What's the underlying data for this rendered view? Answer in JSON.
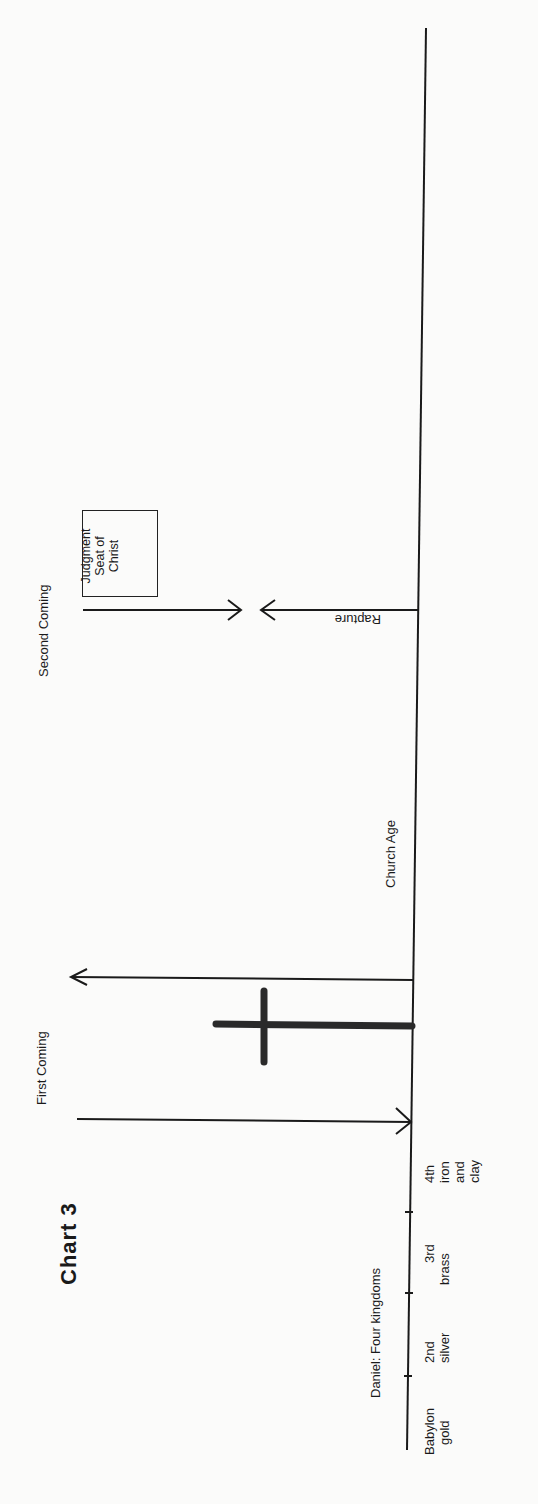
{
  "title": "Chart 3",
  "daniel_label": "Daniel:  Four kingdoms",
  "kingdoms": [
    {
      "name": "Babylon",
      "metal": "gold"
    },
    {
      "name": "2nd",
      "metal": "silver"
    },
    {
      "name": "3rd",
      "metal": "brass"
    },
    {
      "name": "4th",
      "metal_lines": [
        "iron",
        "and",
        "clay"
      ]
    }
  ],
  "events": {
    "first_coming": "First  Coming",
    "church_age": "Church  Age",
    "second_coming": "Second  Coming",
    "rapture": "Rapture",
    "judgment_seat": [
      "Judgment",
      "Seat of",
      "Christ"
    ]
  },
  "symbols": {
    "cross": "cross-icon"
  },
  "colors": {
    "ink": "#1a1a1a",
    "paper": "#fbfbfa"
  }
}
